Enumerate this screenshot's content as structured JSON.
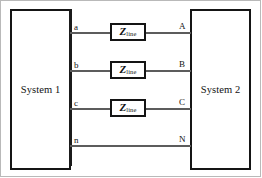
{
  "figure": {
    "type": "single-line-diagram",
    "frame_visible": true
  },
  "blocks": [
    {
      "id": "system-1",
      "label": "System 1",
      "x": 10,
      "y": 9,
      "width": 61,
      "height": 161
    },
    {
      "id": "system-2",
      "label": "System 2",
      "x": 190,
      "y": 9,
      "width": 61,
      "height": 161
    }
  ],
  "bus_bar": {
    "label": "system-1-bus",
    "x": 69,
    "y_top": 9,
    "y_bottom": 166
  },
  "conductors": [
    {
      "id": "phase-a",
      "left_terminal": "a",
      "right_terminal": "A",
      "y": 32,
      "x_start": 70,
      "x_end": 191,
      "has_impedance": true
    },
    {
      "id": "phase-b",
      "left_terminal": "b",
      "right_terminal": "B",
      "y": 70,
      "x_start": 70,
      "x_end": 191,
      "has_impedance": true
    },
    {
      "id": "phase-c",
      "left_terminal": "c",
      "right_terminal": "C",
      "y": 108,
      "x_start": 70,
      "x_end": 191,
      "has_impedance": true
    },
    {
      "id": "neutral",
      "left_terminal": "n",
      "right_terminal": "N",
      "y": 145,
      "x_start": 70,
      "x_end": 191,
      "has_impedance": false
    }
  ],
  "impedances": [
    {
      "id": "z-line-a",
      "symbol": "Z",
      "subscript": "line",
      "on_conductor": "phase-a",
      "x": 110,
      "y": 23,
      "width": 36,
      "height": 18
    },
    {
      "id": "z-line-b",
      "symbol": "Z",
      "subscript": "line",
      "on_conductor": "phase-b",
      "x": 110,
      "y": 61,
      "width": 36,
      "height": 18
    },
    {
      "id": "z-line-c",
      "symbol": "Z",
      "subscript": "line",
      "on_conductor": "phase-c",
      "x": 110,
      "y": 99,
      "width": 36,
      "height": 18
    }
  ],
  "colors": {
    "line": "#5c5c5c",
    "block_border": "#151515",
    "bus_bar": "#1b1b1b",
    "text": "#121212",
    "frame": "#b9b9b9",
    "background": "#ffffff"
  }
}
